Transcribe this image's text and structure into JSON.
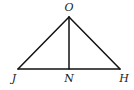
{
  "diagram": {
    "type": "geometry-triangle",
    "points": {
      "O": {
        "label": "O",
        "x": 69,
        "y": 17,
        "label_x": 69,
        "label_y": 11
      },
      "J": {
        "label": "J",
        "x": 18,
        "y": 69,
        "label_x": 14,
        "label_y": 82
      },
      "N": {
        "label": "N",
        "x": 69,
        "y": 69,
        "label_x": 69,
        "label_y": 82
      },
      "H": {
        "label": "H",
        "x": 120,
        "y": 69,
        "label_x": 124,
        "label_y": 82
      }
    },
    "segments": [
      {
        "from": "O",
        "to": "J"
      },
      {
        "from": "O",
        "to": "H"
      },
      {
        "from": "J",
        "to": "H"
      },
      {
        "from": "O",
        "to": "N"
      }
    ],
    "colors": {
      "stroke": "#111111",
      "label": "#222222",
      "background": "#ffffff"
    }
  }
}
